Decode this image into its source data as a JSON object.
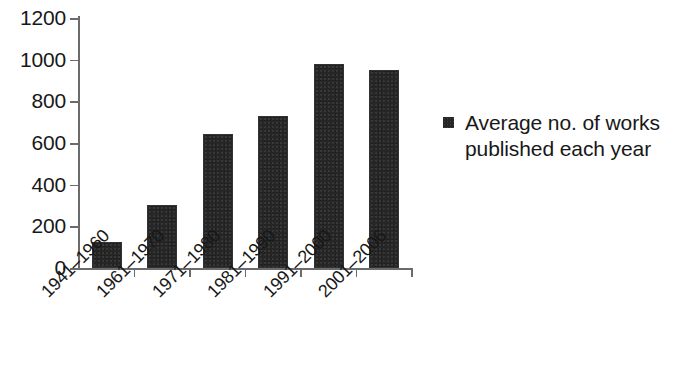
{
  "chart_data": {
    "type": "bar",
    "title": "",
    "subtitle": "",
    "xlabel": "",
    "ylabel": "",
    "categories": [
      "1941–1960",
      "1961–1970",
      "1971–1980",
      "1981–1990",
      "1991–2000",
      "2001–2006"
    ],
    "series": [
      {
        "name": "Average no. of works published each year",
        "values": [
          115,
          293,
          633,
          719,
          969,
          940
        ],
        "color": "#262626"
      }
    ],
    "ylim": [
      0,
      1200
    ],
    "yticks": [
      0,
      200,
      400,
      600,
      800,
      1000,
      1200
    ],
    "ytick_labels": [
      "0",
      "200",
      "400",
      "600",
      "800",
      "1000",
      "1200"
    ],
    "grid": false,
    "legend": {
      "position": "right",
      "entries": [
        {
          "label_line1": "Average no. of works",
          "label_line2": "published each year",
          "marker": "filled-square",
          "color": "#262626"
        }
      ]
    },
    "axis_color": "#6b6b6b",
    "text_color": "#181818",
    "background": "#ffffff",
    "xtick_label_rotation": -45
  }
}
